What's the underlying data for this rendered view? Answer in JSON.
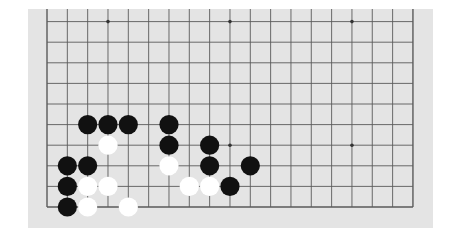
{
  "board": {
    "size": 19,
    "visible_columns": 19,
    "visible_rows": 10,
    "cropped_top": true,
    "background_color": "#e4e4e4",
    "line_color": "#5a5a5a",
    "black_color": "#111111",
    "white_color": "#ffffff",
    "star_points": [
      {
        "col": 3,
        "row": 9
      },
      {
        "col": 9,
        "row": 9
      },
      {
        "col": 15,
        "row": 9
      },
      {
        "col": 9,
        "row": 3
      },
      {
        "col": 15,
        "row": 3
      }
    ],
    "stones": [
      {
        "color": "black",
        "col": 2,
        "row": 4
      },
      {
        "color": "black",
        "col": 3,
        "row": 4
      },
      {
        "color": "black",
        "col": 4,
        "row": 4
      },
      {
        "color": "black",
        "col": 6,
        "row": 4
      },
      {
        "color": "white",
        "col": 3,
        "row": 3
      },
      {
        "color": "black",
        "col": 6,
        "row": 3
      },
      {
        "color": "black",
        "col": 8,
        "row": 3
      },
      {
        "color": "black",
        "col": 1,
        "row": 2
      },
      {
        "color": "black",
        "col": 2,
        "row": 2
      },
      {
        "color": "white",
        "col": 6,
        "row": 2
      },
      {
        "color": "black",
        "col": 8,
        "row": 2
      },
      {
        "color": "black",
        "col": 10,
        "row": 2
      },
      {
        "color": "black",
        "col": 1,
        "row": 1
      },
      {
        "color": "white",
        "col": 2,
        "row": 1
      },
      {
        "color": "white",
        "col": 3,
        "row": 1
      },
      {
        "color": "white",
        "col": 7,
        "row": 1
      },
      {
        "color": "white",
        "col": 8,
        "row": 1
      },
      {
        "color": "black",
        "col": 9,
        "row": 1
      },
      {
        "color": "black",
        "col": 1,
        "row": 0
      },
      {
        "color": "white",
        "col": 2,
        "row": 0
      },
      {
        "color": "white",
        "col": 4,
        "row": 0
      }
    ]
  }
}
